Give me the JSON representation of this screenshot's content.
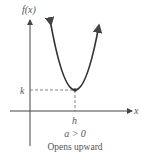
{
  "diagram": {
    "y_axis_label": "f(x)",
    "x_axis_label": "x",
    "vertex_x_label": "h",
    "vertex_y_label": "k",
    "condition": "a > 0",
    "caption": "Opens upward",
    "colors": {
      "axis": "#444444",
      "curve": "#333333",
      "dashed": "#666666",
      "text": "#555555"
    }
  }
}
